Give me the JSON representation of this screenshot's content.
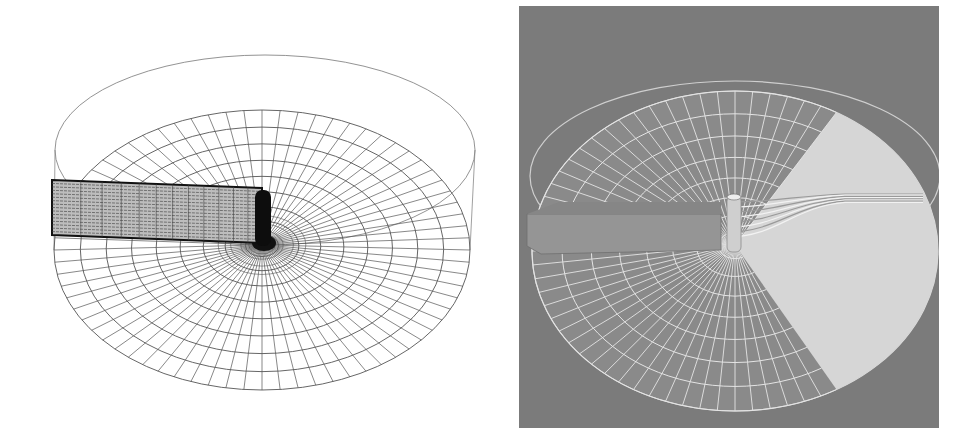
{
  "figure": {
    "panels": [
      {
        "id": "left",
        "description": "wireframe computational mesh",
        "background": "#ffffff",
        "line_color": "#555555",
        "dense_color": "#111111",
        "geometry": {
          "domain_center": [
            262,
            245
          ],
          "outer_top_ellipse": {
            "cx": 265,
            "cy": 150,
            "rx": 210,
            "ry": 95
          },
          "mesh_disk": {
            "cx": 262,
            "cy": 250,
            "rx": 208,
            "ry": 140
          },
          "radial_divisions": 72,
          "ring_count": 9,
          "channel": {
            "x1": 52,
            "y_top": 180,
            "x2": 262,
            "y_bottom": 235
          },
          "cylinder": {
            "x": 255,
            "y1": 190,
            "y2": 246,
            "w": 16
          }
        }
      },
      {
        "id": "right",
        "description": "rendered mesh with cut-away sector and streamlines",
        "background": "#7b7b7b",
        "mesh_line_color": "#e4e4e4",
        "wedge_color": "#d6d6d6",
        "channel_color": "#959595",
        "geometry": {
          "domain_center": [
            216,
            239
          ],
          "outer_top_ellipse": {
            "cx": 216,
            "cy": 170,
            "rx": 205,
            "ry": 95
          },
          "mesh_disk": {
            "cx": 216,
            "cy": 245,
            "rx": 203,
            "ry": 160
          },
          "radial_divisions": 72,
          "ring_count": 8,
          "wedge_angles_deg": [
            -60,
            60
          ],
          "streamline_count": 8
        }
      }
    ]
  }
}
